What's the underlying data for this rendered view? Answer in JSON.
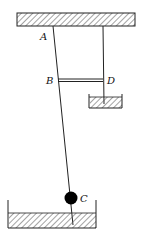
{
  "diagram": {
    "type": "physics-apparatus",
    "labels": {
      "A": "A",
      "B": "B",
      "C": "C",
      "D": "D"
    },
    "elements": [
      "ceiling-support",
      "rod-AC",
      "string-to-small-container",
      "bar-BD",
      "small-container-with-liquid",
      "ball-C",
      "large-container-with-liquid"
    ],
    "colors": {
      "line": "#222222",
      "ball": "#000000",
      "hatch": "#555555"
    }
  }
}
